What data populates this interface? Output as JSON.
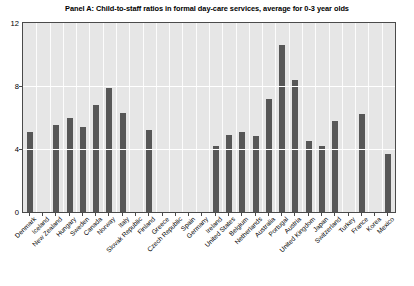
{
  "chart_data": {
    "type": "bar",
    "title": "Panel A: Child-to-staff ratios in formal day-care services, average for 0-3 year olds",
    "xlabel": "",
    "ylabel": "",
    "ylim": [
      0,
      12
    ],
    "yticks": [
      0,
      4,
      8,
      12
    ],
    "ytick_labels": [
      "0",
      "4",
      "8",
      "12"
    ],
    "grid": true,
    "legend": "none",
    "bar_color": "#575757",
    "plot_background": "#e6e6e6",
    "gridline_color": "#ffffff",
    "axis_color": "#4a4a4a",
    "categories": [
      "Denmark",
      "Iceland",
      "New Zealand",
      "Hungary",
      "Sweden",
      "Canada",
      "Norway",
      "Italy",
      "Slovak Republic",
      "Finland",
      "Greece",
      "Czech Republic",
      "Spain",
      "Germany",
      "Ireland",
      "United States",
      "Belgium",
      "Netherlands",
      "Australia",
      "Portugal",
      "Austria",
      "United Kingdom",
      "Japan",
      "Switzerland",
      "Turkey",
      "France",
      "Korea",
      "Mexico"
    ],
    "values": [
      5.1,
      null,
      5.5,
      6.0,
      5.4,
      6.8,
      7.9,
      6.3,
      null,
      5.2,
      null,
      null,
      null,
      null,
      4.2,
      4.9,
      5.1,
      4.8,
      7.2,
      10.6,
      8.4,
      4.5,
      4.2,
      5.8,
      null,
      6.2,
      null,
      3.7
    ]
  }
}
